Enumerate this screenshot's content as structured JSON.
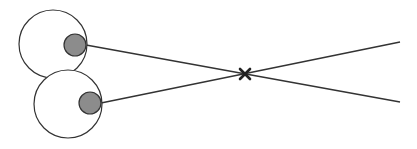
{
  "diagram": {
    "colors": {
      "background": "#ffffff",
      "stroke": "#333333",
      "pupil_fill": "#8c8c8c",
      "eye_fill": "#ffffff"
    },
    "eyes": [
      {
        "id": "upper-eye",
        "cx": 53,
        "cy": 44,
        "r": 34,
        "pupil": {
          "cx": 75,
          "cy": 45,
          "r": 11
        }
      },
      {
        "id": "lower-eye",
        "cx": 68,
        "cy": 104,
        "r": 34,
        "pupil": {
          "cx": 90,
          "cy": 103,
          "r": 11
        }
      }
    ],
    "sight_lines": [
      {
        "id": "upper-sight-line",
        "x1": 86,
        "y1": 45,
        "x2": 400,
        "y2": 102
      },
      {
        "id": "lower-sight-line",
        "x1": 101,
        "y1": 103,
        "x2": 400,
        "y2": 42
      }
    ],
    "intersection_marker": {
      "label": "×",
      "x": 245,
      "y": 74
    }
  }
}
